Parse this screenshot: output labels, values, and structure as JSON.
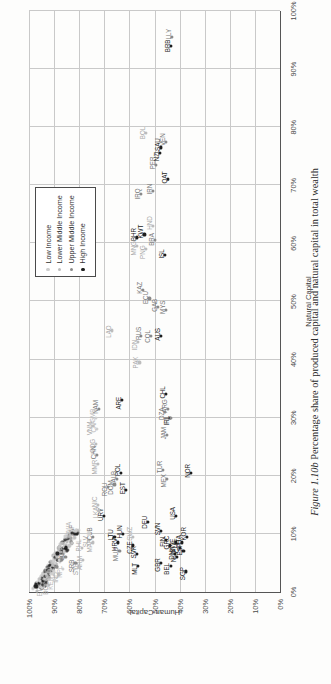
{
  "caption": {
    "figure_number": "Figure 1.10b",
    "text": "Percentage share of produced capital and natural capital in total wealth"
  },
  "legend": {
    "items": [
      {
        "label": "Low Income",
        "key": "low",
        "color": "#cfcfcf"
      },
      {
        "label": "Lower Middle Income",
        "key": "lowmid",
        "color": "#bdbdbd"
      },
      {
        "label": "Upper Middle Income",
        "key": "uppmid",
        "color": "#8a8a8a"
      },
      {
        "label": "High Income",
        "key": "high",
        "color": "#1d1d1d"
      }
    ]
  },
  "chart_data": {
    "type": "scatter",
    "title": "",
    "xlabel": "Natural Capital",
    "ylabel": "Human Capital",
    "xlim": [
      0,
      100
    ],
    "ylim": [
      0,
      100
    ],
    "xticks": [
      "0%",
      "10%",
      "20%",
      "30%",
      "40%",
      "50%",
      "60%",
      "70%",
      "80%",
      "90%",
      "100%"
    ],
    "yticks": [
      "0%",
      "10%",
      "20%",
      "30%",
      "40%",
      "50%",
      "60%",
      "70%",
      "80%",
      "90%",
      "100%"
    ],
    "grid": true,
    "legend_position": "top-right",
    "series": [
      {
        "name": "Low Income",
        "key": "low"
      },
      {
        "name": "Lower Middle Income",
        "key": "lowmid"
      },
      {
        "name": "Upper Middle Income",
        "key": "uppmid"
      },
      {
        "name": "High Income",
        "key": "high"
      }
    ],
    "points": [
      {
        "label": "LAO",
        "x": 45.0,
        "y": 67.0,
        "g": "lowmid",
        "lx": -1,
        "ly": -4
      },
      {
        "label": "PAK",
        "x": 39.5,
        "y": 56.0,
        "g": "lowmid",
        "lx": 0,
        "ly": -4
      },
      {
        "label": "COG",
        "x": 25.5,
        "y": 73.5,
        "g": "lowmid",
        "lx": -2,
        "ly": -4
      },
      {
        "label": "CAF",
        "x": 28.0,
        "y": 73.0,
        "g": "low",
        "lx": 3,
        "ly": -4
      },
      {
        "label": "ZAF",
        "x": 10.0,
        "y": 81.5,
        "g": "uppmid",
        "lx": 3,
        "ly": -4
      },
      {
        "label": "PHL",
        "x": 7.5,
        "y": 79.0,
        "g": "lowmid",
        "lx": 3,
        "ly": -4
      },
      {
        "label": "RWA",
        "x": 10.5,
        "y": 83.0,
        "g": "low",
        "lx": 2,
        "ly": -4
      },
      {
        "label": "RUS",
        "x": 44.0,
        "y": 55.5,
        "g": "uppmid",
        "lx": 3,
        "ly": -3
      },
      {
        "label": "IDN",
        "x": 43.0,
        "y": 56.5,
        "g": "lowmid",
        "lx": -3,
        "ly": -4
      },
      {
        "label": "COL",
        "x": 44.0,
        "y": 51.5,
        "g": "uppmid",
        "lx": 0,
        "ly": -4
      },
      {
        "label": "AUS",
        "x": 44.0,
        "y": 47.5,
        "g": "high",
        "lx": 2,
        "ly": -4
      },
      {
        "label": "KAZ",
        "x": 52.0,
        "y": 54.5,
        "g": "uppmid",
        "lx": 2,
        "ly": -4
      },
      {
        "label": "ECU",
        "x": 50.5,
        "y": 52.0,
        "g": "uppmid",
        "lx": 1,
        "ly": -4
      },
      {
        "label": "GAB",
        "x": 49.0,
        "y": 48.5,
        "g": "uppmid",
        "lx": 2,
        "ly": -4
      },
      {
        "label": "MNG",
        "x": 59.5,
        "y": 57.0,
        "g": "lowmid",
        "lx": -2,
        "ly": -4
      },
      {
        "label": "BHR",
        "x": 61.0,
        "y": 57.0,
        "g": "high",
        "lx": 3,
        "ly": -4
      },
      {
        "label": "PNG",
        "x": 59.0,
        "y": 53.5,
        "g": "lowmid",
        "lx": -3,
        "ly": -4
      },
      {
        "label": "KWT",
        "x": 61.5,
        "y": 54.0,
        "g": "high",
        "lx": 3,
        "ly": -4
      },
      {
        "label": "BRA",
        "x": 60.5,
        "y": 50.0,
        "g": "uppmid",
        "lx": 1,
        "ly": -4
      },
      {
        "label": "HND",
        "x": 63.0,
        "y": 50.5,
        "g": "lowmid",
        "lx": 3,
        "ly": -4
      },
      {
        "label": "ISL",
        "x": 58.0,
        "y": 46.0,
        "g": "high",
        "lx": 1,
        "ly": -4
      },
      {
        "label": "IRQ",
        "x": 68.5,
        "y": 55.5,
        "g": "uppmid",
        "lx": 0,
        "ly": -4
      },
      {
        "label": "IRN",
        "x": 69.0,
        "y": 50.5,
        "g": "uppmid",
        "lx": 2,
        "ly": -4
      },
      {
        "label": "PER",
        "x": 73.5,
        "y": 49.5,
        "g": "uppmid",
        "lx": 2,
        "ly": -4
      },
      {
        "label": "BOL",
        "x": 79.0,
        "y": 53.5,
        "g": "lowmid",
        "lx": 0,
        "ly": -4
      },
      {
        "label": "NZL",
        "x": 75.5,
        "y": 48.0,
        "g": "high",
        "lx": -2,
        "ly": -4
      },
      {
        "label": "SAU",
        "x": 76.5,
        "y": 47.5,
        "g": "high",
        "lx": 3,
        "ly": -4
      },
      {
        "label": "VEN",
        "x": 77.5,
        "y": 45.5,
        "g": "uppmid",
        "lx": 2,
        "ly": -4
      },
      {
        "label": "QAT",
        "x": 71.0,
        "y": 44.5,
        "g": "high",
        "lx": 2,
        "ly": -4
      },
      {
        "label": "BRB",
        "x": 94.0,
        "y": 43.5,
        "g": "high",
        "lx": 0,
        "ly": -4
      },
      {
        "label": "LLY",
        "x": 95.5,
        "y": 43.0,
        "g": "uppmid",
        "lx": 3,
        "ly": -4
      },
      {
        "label": "ARE",
        "x": 33.0,
        "y": 63.0,
        "g": "high",
        "lx": -3,
        "ly": -4
      },
      {
        "label": "NAM",
        "x": 31.5,
        "y": 72.0,
        "g": "uppmid",
        "lx": 2,
        "ly": -4
      },
      {
        "label": "GMB",
        "x": 30.0,
        "y": 73.5,
        "g": "low",
        "lx": 2,
        "ly": -4
      },
      {
        "label": "VNM",
        "x": 28.5,
        "y": 74.5,
        "g": "lowmid",
        "lx": -2,
        "ly": -4
      },
      {
        "label": "CHN",
        "x": 23.5,
        "y": 73.0,
        "g": "uppmid",
        "lx": 3,
        "ly": -4
      },
      {
        "label": "MMR",
        "x": 22.0,
        "y": 72.5,
        "g": "lowmid",
        "lx": -3,
        "ly": -4
      },
      {
        "label": "POL",
        "x": 20.5,
        "y": 63.5,
        "g": "high",
        "lx": 3,
        "ly": -4
      },
      {
        "label": "ALB",
        "x": 19.5,
        "y": 65.0,
        "g": "uppmid",
        "lx": 2,
        "ly": -4
      },
      {
        "label": "DOM",
        "x": 18.5,
        "y": 66.0,
        "g": "uppmid",
        "lx": -3,
        "ly": -4
      },
      {
        "label": "ROU",
        "x": 18.0,
        "y": 68.5,
        "g": "uppmid",
        "lx": -2,
        "ly": -4
      },
      {
        "label": "EST",
        "x": 17.5,
        "y": 61.5,
        "g": "high",
        "lx": 2,
        "ly": -4
      },
      {
        "label": "URY",
        "x": 13.0,
        "y": 70.0,
        "g": "high",
        "lx": 2,
        "ly": -4
      },
      {
        "label": "LKA",
        "x": 14.0,
        "y": 72.0,
        "g": "lowmid",
        "lx": -2,
        "ly": -4
      },
      {
        "label": "NIC",
        "x": 15.0,
        "y": 72.5,
        "g": "lowmid",
        "lx": 3,
        "ly": -4
      },
      {
        "label": "SLV",
        "x": 9.0,
        "y": 76.0,
        "g": "lowmid",
        "lx": -2,
        "ly": -4
      },
      {
        "label": "CUB",
        "x": 9.5,
        "y": 74.5,
        "g": "uppmid",
        "lx": 3,
        "ly": -4
      },
      {
        "label": "MAR",
        "x": 8.5,
        "y": 74.5,
        "g": "lowmid",
        "lx": -3,
        "ly": -4
      },
      {
        "label": "HUN",
        "x": 10.0,
        "y": 62.5,
        "g": "high",
        "lx": 2,
        "ly": -4
      },
      {
        "label": "HRV",
        "x": 8.5,
        "y": 64.5,
        "g": "high",
        "lx": -2,
        "ly": -4
      },
      {
        "label": "LTU",
        "x": 9.5,
        "y": 66.0,
        "g": "high",
        "lx": 2,
        "ly": -4
      },
      {
        "label": "MUS",
        "x": 7.0,
        "y": 64.0,
        "g": "uppmid",
        "lx": -3,
        "ly": -4
      },
      {
        "label": "CZE",
        "x": 8.0,
        "y": 58.5,
        "g": "high",
        "lx": -2,
        "ly": -4
      },
      {
        "label": "SWZ",
        "x": 9.5,
        "y": 58.5,
        "g": "lowmid",
        "lx": 3,
        "ly": -4
      },
      {
        "label": "SVK",
        "x": 6.5,
        "y": 57.0,
        "g": "high",
        "lx": 2,
        "ly": -4
      },
      {
        "label": "MLT",
        "x": 4.5,
        "y": 56.5,
        "g": "high",
        "lx": -3,
        "ly": -4
      },
      {
        "label": "DEU",
        "x": 12.0,
        "y": 52.5,
        "g": "high",
        "lx": 0,
        "ly": -4
      },
      {
        "label": "SVN",
        "x": 10.5,
        "y": 47.5,
        "g": "high",
        "lx": 2,
        "ly": -4
      },
      {
        "label": "GRC",
        "x": 8.0,
        "y": 44.0,
        "g": "high",
        "lx": 3,
        "ly": -4
      },
      {
        "label": "FIN",
        "x": 9.0,
        "y": 45.5,
        "g": "high",
        "lx": -2,
        "ly": -4
      },
      {
        "label": "MEX",
        "x": 19.5,
        "y": 45.0,
        "g": "uppmid",
        "lx": -2,
        "ly": -4
      },
      {
        "label": "TUR",
        "x": 21.0,
        "y": 46.5,
        "g": "uppmid",
        "lx": 3,
        "ly": -4
      },
      {
        "label": "JAM",
        "x": 27.0,
        "y": 45.0,
        "g": "uppmid",
        "lx": 2,
        "ly": -4
      },
      {
        "label": "CHL",
        "x": 34.0,
        "y": 45.5,
        "g": "high",
        "lx": 2,
        "ly": -4
      },
      {
        "label": "ARG",
        "x": 31.5,
        "y": 44.5,
        "g": "uppmid",
        "lx": 3,
        "ly": -4
      },
      {
        "label": "DZA",
        "x": 31.0,
        "y": 46.0,
        "g": "uppmid",
        "lx": -2,
        "ly": -4
      },
      {
        "label": "IRL",
        "x": 30.0,
        "y": 44.0,
        "g": "high",
        "lx": -3,
        "ly": -4
      },
      {
        "label": "FJI",
        "x": 30.0,
        "y": 43.5,
        "g": "uppmid",
        "lx": -3,
        "ly": -5
      },
      {
        "label": "NOR",
        "x": 20.5,
        "y": 35.5,
        "g": "high",
        "lx": 2,
        "ly": -4
      },
      {
        "label": "KOR",
        "x": 9.5,
        "y": 37.0,
        "g": "high",
        "lx": 3,
        "ly": -4
      },
      {
        "label": "USA",
        "x": 13.0,
        "y": 41.5,
        "g": "high",
        "lx": 3,
        "ly": -4
      },
      {
        "label": "SWE",
        "x": 8.5,
        "y": 41.5,
        "g": "high",
        "lx": -3,
        "ly": -4
      },
      {
        "label": "GBR",
        "x": 5.0,
        "y": 47.5,
        "g": "high",
        "lx": -2,
        "ly": -4
      },
      {
        "label": "BEL",
        "x": 4.5,
        "y": 43.5,
        "g": "high",
        "lx": -3,
        "ly": -5
      },
      {
        "label": "DNK",
        "x": 6.5,
        "y": 42.0,
        "g": "high",
        "lx": 1,
        "ly": -4
      },
      {
        "label": "NLD",
        "x": 6.0,
        "y": 41.0,
        "g": "high",
        "lx": 1,
        "ly": -4
      },
      {
        "label": "CHE",
        "x": 7.5,
        "y": 40.0,
        "g": "high",
        "lx": 2,
        "ly": -4
      },
      {
        "label": "SGP",
        "x": 3.5,
        "y": 37.5,
        "g": "high",
        "lx": -2,
        "ly": -4
      },
      {
        "label": "ESP",
        "x": 7.0,
        "y": 38.5,
        "g": "high",
        "lx": 2,
        "ly": -4
      },
      {
        "label": "ITA",
        "x": 8.5,
        "y": 39.0,
        "g": "high",
        "lx": 3,
        "ly": -4
      },
      {
        "label": "MYS",
        "x": 48.5,
        "y": 45.5,
        "g": "uppmid",
        "lx": 3,
        "ly": -4
      },
      {
        "label": "ARM",
        "x": 5.5,
        "y": 78.5,
        "g": "lowmid",
        "lx": -3,
        "ly": -4
      },
      {
        "label": "SYR",
        "x": 4.5,
        "y": 80.0,
        "g": "lowmid",
        "lx": -3,
        "ly": -4
      },
      {
        "label": "SRB",
        "x": 5.0,
        "y": 81.5,
        "g": "uppmid",
        "lx": -3,
        "ly": -4
      },
      {
        "label": "JOR",
        "x": 6.0,
        "y": 85.5,
        "g": "uppmid",
        "lx": 3,
        "ly": -4
      },
      {
        "label": "NPL",
        "x": 4.0,
        "y": 86.5,
        "g": "low",
        "lx": -3,
        "ly": -4
      },
      {
        "label": "IND",
        "x": 3.0,
        "y": 88.0,
        "g": "lowmid",
        "lx": -3,
        "ly": -4
      },
      {
        "label": "KEN",
        "x": 2.0,
        "y": 90.0,
        "g": "low",
        "lx": -3,
        "ly": -4
      },
      {
        "label": "BGD",
        "x": 1.2,
        "y": 92.0,
        "g": "lowmid",
        "lx": -3,
        "ly": -4
      },
      {
        "label": "ETH",
        "x": 0.8,
        "y": 94.5,
        "g": "low",
        "lx": -3,
        "ly": -4
      }
    ],
    "cluster_note": "dense unlabeled cluster near origin along the high-human-capital edge"
  }
}
